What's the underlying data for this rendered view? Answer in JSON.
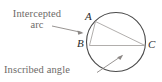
{
  "figure": {
    "background_color": "#ffffff",
    "callouts": {
      "intercepted_arc": "Intercepted\narc",
      "intercepted_arc_line1": "Intercepted",
      "intercepted_arc_line2": "arc",
      "inscribed_angle": "Inscribed angle"
    },
    "vertices": {
      "a": "A",
      "b": "B",
      "c": "C"
    },
    "colors": {
      "callout_text": "#6e6a68",
      "vertex_text": "#2b2b2b",
      "circle_stroke": "#4a4a4a",
      "chord_stroke": "#a8a5a3",
      "arrow_stroke": "#8c8886"
    }
  },
  "geometry": {
    "circle": {
      "cx": 116,
      "cy": 42,
      "r": 29.5
    },
    "points": {
      "A": {
        "x": 95.5,
        "y": 21.5
      },
      "B": {
        "x": 89.5,
        "y": 45.5
      },
      "C": {
        "x": 145.0,
        "y": 45.5
      }
    },
    "chords": [
      {
        "name": "chord-ab",
        "from": "A",
        "to": "B"
      },
      {
        "name": "chord-ac",
        "from": "A",
        "to": "C"
      },
      {
        "name": "chord-bc",
        "from": "B",
        "to": "C"
      }
    ],
    "arrows": [
      {
        "name": "arrow-intercepted-arc",
        "x1": 52,
        "y1": 26,
        "x2": 84,
        "y2": 33
      },
      {
        "name": "arrow-inscribed-angle",
        "x1": 98,
        "y1": 72,
        "x2": 123,
        "y2": 55
      }
    ]
  }
}
